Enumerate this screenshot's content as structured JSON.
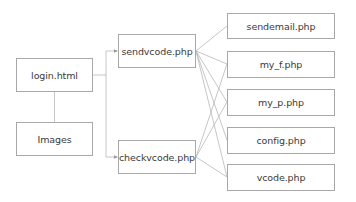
{
  "diagram": {
    "type": "file-dependency-tree",
    "colors": {
      "box_border": "#a8a8a8",
      "line": "#b8b8b8",
      "text": "#3a3a3a",
      "background": "#ffffff"
    },
    "nodes": {
      "login": {
        "label": "login.html",
        "x": 16,
        "y": 58,
        "w": 77,
        "h": 34
      },
      "images": {
        "label": "Images",
        "x": 16,
        "y": 122,
        "w": 77,
        "h": 34
      },
      "sendvcode": {
        "label": "sendvcode.php",
        "x": 118,
        "y": 34,
        "w": 78,
        "h": 34
      },
      "checkvcode": {
        "label": "checkvcode.php",
        "x": 118,
        "y": 140,
        "w": 78,
        "h": 34
      },
      "sendemail": {
        "label": "sendemail.php",
        "x": 227,
        "y": 13,
        "w": 108,
        "h": 26
      },
      "my_f": {
        "label": "my_f.php",
        "x": 227,
        "y": 51,
        "w": 108,
        "h": 27
      },
      "my_p": {
        "label": "my_p.php",
        "x": 227,
        "y": 89,
        "w": 108,
        "h": 27
      },
      "config": {
        "label": "config.php",
        "x": 227,
        "y": 127,
        "w": 108,
        "h": 27
      },
      "vcode": {
        "label": "vcode.php",
        "x": 227,
        "y": 164,
        "w": 108,
        "h": 27
      }
    },
    "edges": [
      {
        "from": "login",
        "to": "images",
        "style": "vertical"
      },
      {
        "from": "login",
        "to": "sendvcode",
        "style": "elbow-arrow"
      },
      {
        "from": "login",
        "to": "checkvcode",
        "style": "elbow-arrow"
      },
      {
        "from": "sendvcode",
        "to": "sendemail"
      },
      {
        "from": "sendvcode",
        "to": "my_f"
      },
      {
        "from": "sendvcode",
        "to": "my_p"
      },
      {
        "from": "sendvcode",
        "to": "config"
      },
      {
        "from": "sendvcode",
        "to": "vcode"
      },
      {
        "from": "checkvcode",
        "to": "my_f"
      },
      {
        "from": "checkvcode",
        "to": "my_p"
      },
      {
        "from": "checkvcode",
        "to": "vcode"
      }
    ]
  }
}
